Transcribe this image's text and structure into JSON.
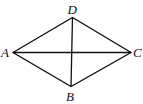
{
  "diagram": {
    "type": "quadrilateral-with-diagonals",
    "vertices": [
      {
        "label": "A",
        "x": 13,
        "y": 52.5
      },
      {
        "label": "D",
        "x": 72.5,
        "y": 17.5
      },
      {
        "label": "C",
        "x": 131,
        "y": 52.5
      },
      {
        "label": "B",
        "x": 71,
        "y": 86.5
      }
    ],
    "edges": [
      [
        "A",
        "D"
      ],
      [
        "D",
        "C"
      ],
      [
        "C",
        "B"
      ],
      [
        "B",
        "A"
      ]
    ],
    "diagonals": [
      [
        "A",
        "C"
      ],
      [
        "D",
        "B"
      ]
    ],
    "labels": {
      "A": "A",
      "B": "B",
      "C": "C",
      "D": "D"
    }
  }
}
